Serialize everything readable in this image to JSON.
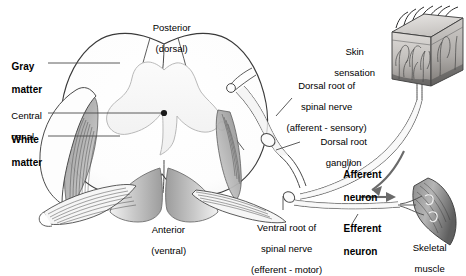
{
  "figure": {
    "background_color": "#ffffff",
    "line_color": "#3a3a3a",
    "text_color": "#000000"
  },
  "labels": {
    "posterior": {
      "line1": "Posterior",
      "line2": "(dorsal)"
    },
    "anterior": {
      "line1": "Anterior",
      "line2": "(ventral)"
    },
    "gray_matter": {
      "line1": "Gray",
      "line2": "matter"
    },
    "central_canal": {
      "line1": "Central",
      "line2": "canal"
    },
    "white_matter": {
      "line1": "White",
      "line2": "matter"
    },
    "dorsal_root": {
      "line1": "Dorsal root of",
      "line2": "spinal nerve",
      "line3": "(afferent - sensory)"
    },
    "dorsal_root_ganglion": {
      "line1": "Dorsal root",
      "line2": "ganglion"
    },
    "ventral_root": {
      "line1": "Ventral root of",
      "line2": "spinal nerve",
      "line3": "(efferent - motor)"
    },
    "skin_sensation": {
      "line1": "Skin",
      "line2": "sensation"
    },
    "afferent_neuron": {
      "line1": "Afferent",
      "line2": "neuron"
    },
    "efferent_neuron": {
      "line1": "Efferent",
      "line2": "neuron"
    },
    "skeletal_muscle": {
      "line1": "Skeletal",
      "line2": "muscle"
    }
  },
  "structures": [
    {
      "name": "spinal-cord-cross-section",
      "description": "Oval cord with butterfly gray matter"
    },
    {
      "name": "dorsal-root-ganglion",
      "description": "Oval swelling on dorsal root"
    },
    {
      "name": "skin-block",
      "description": "3D skin wedge with hairs and nerve endings"
    },
    {
      "name": "skeletal-muscle",
      "description": "Fusiform muscle with motor end plates"
    },
    {
      "name": "afferent-arrow",
      "description": "Curved arrow toward cord"
    },
    {
      "name": "efferent-arrow",
      "description": "Straight arrow toward muscle"
    }
  ]
}
